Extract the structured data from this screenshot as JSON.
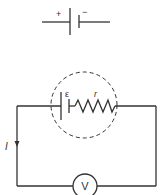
{
  "battery_symbol": {
    "plus_label": "+",
    "minus_label": "−"
  },
  "circuit": {
    "emf_label": "ε",
    "internal_resistance_label": "r",
    "current_label": "I",
    "voltmeter_label": "V"
  },
  "colors": {
    "line": "#333333",
    "background": "#ffffff"
  }
}
